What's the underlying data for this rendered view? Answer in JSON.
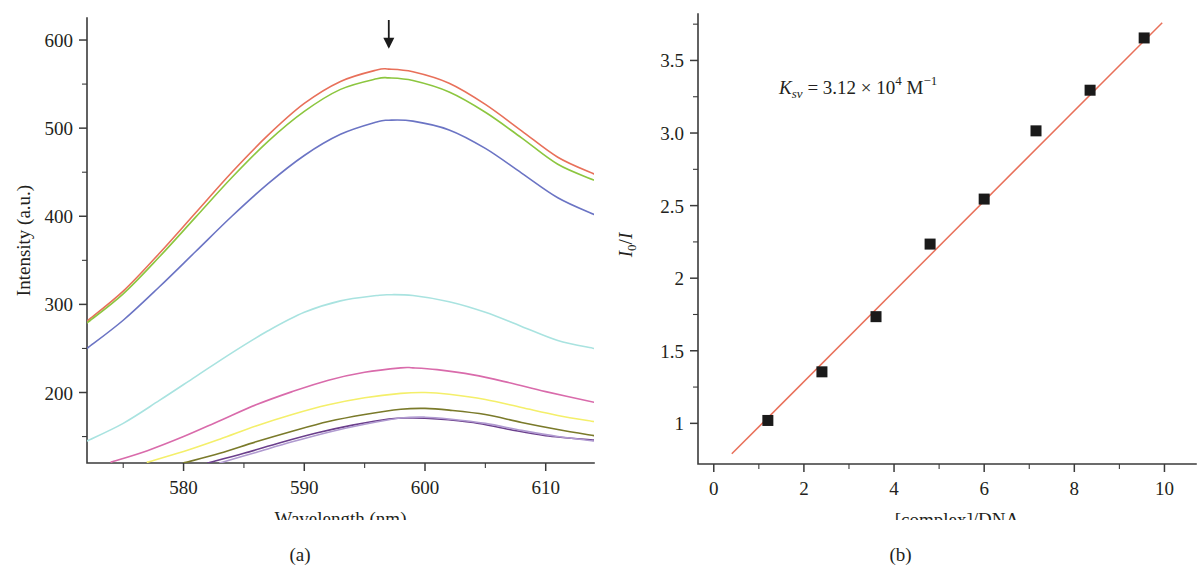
{
  "figure": {
    "panels": [
      {
        "id": "a",
        "caption": "(a)"
      },
      {
        "id": "b",
        "caption": "(b)"
      }
    ]
  },
  "chart_data": [
    {
      "panel": "a",
      "type": "line",
      "title": "",
      "xlabel": "Wavelength (nm)",
      "ylabel": "Intensity (a.u.)",
      "xlim": [
        572,
        614
      ],
      "ylim": [
        120,
        625
      ],
      "xticks": [
        580,
        590,
        600,
        610
      ],
      "xticklabels": [
        "580",
        "590",
        "600",
        "610"
      ],
      "xminorticks": [
        575,
        585,
        595,
        605
      ],
      "yticks": [
        200,
        300,
        400,
        500,
        600
      ],
      "yticklabels": [
        "200",
        "300",
        "400",
        "500",
        "600"
      ],
      "yminorticks": [
        150,
        250,
        350,
        450,
        550
      ],
      "grid": false,
      "legend": "none",
      "annotations": [
        {
          "name": "downward-arrow",
          "kind": "arrow",
          "x": 597,
          "y_top": 625,
          "y_bottom": 590
        }
      ],
      "series": [
        {
          "name": "curve-1-red",
          "color": "#e8705a",
          "x": [
            572,
            575,
            578,
            581,
            584,
            587,
            590,
            593,
            596,
            597,
            599,
            602,
            605,
            608,
            611,
            614
          ],
          "values": [
            281,
            315,
            358,
            404,
            450,
            492,
            528,
            553,
            566,
            567,
            564,
            551,
            527,
            497,
            467,
            448
          ]
        },
        {
          "name": "curve-2-green",
          "color": "#8cc63f",
          "x": [
            572,
            575,
            578,
            581,
            584,
            587,
            590,
            593,
            596,
            597,
            599,
            602,
            605,
            608,
            611,
            614
          ],
          "values": [
            279,
            312,
            354,
            399,
            444,
            485,
            519,
            544,
            556,
            557,
            554,
            541,
            518,
            489,
            459,
            441
          ]
        },
        {
          "name": "curve-3-blue",
          "color": "#6b74c4",
          "x": [
            572,
            575,
            578,
            581,
            584,
            587,
            590,
            593,
            596,
            597,
            599,
            602,
            605,
            608,
            611,
            614
          ],
          "values": [
            250,
            282,
            320,
            360,
            400,
            437,
            469,
            493,
            507,
            509,
            508,
            498,
            477,
            449,
            421,
            402
          ]
        },
        {
          "name": "curve-4-cyan",
          "color": "#a9e3e0",
          "x": [
            572,
            575,
            578,
            581,
            584,
            587,
            590,
            593,
            596,
            597,
            599,
            602,
            605,
            608,
            611,
            614
          ],
          "values": [
            145,
            165,
            191,
            218,
            245,
            270,
            291,
            304,
            310,
            311,
            310,
            303,
            291,
            275,
            259,
            250
          ]
        },
        {
          "name": "curve-5-magenta",
          "color": "#d96bab",
          "x": [
            574,
            577,
            580,
            583,
            586,
            589,
            592,
            595,
            598,
            599,
            601,
            604,
            607,
            610,
            614
          ],
          "values": [
            121,
            134,
            150,
            168,
            186,
            201,
            214,
            223,
            228,
            228,
            226,
            220,
            211,
            201,
            189
          ]
        },
        {
          "name": "curve-6-yellow",
          "color": "#f4ef6a",
          "x": [
            577,
            580,
            583,
            586,
            589,
            592,
            595,
            598,
            600,
            602,
            605,
            608,
            611,
            614
          ],
          "values": [
            121,
            133,
            147,
            162,
            175,
            186,
            194,
            199,
            200,
            198,
            192,
            183,
            174,
            167
          ]
        },
        {
          "name": "curve-7-olive",
          "color": "#7a7a2a",
          "x": [
            580,
            583,
            586,
            589,
            592,
            595,
            598,
            600,
            602,
            605,
            608,
            611,
            614
          ],
          "values": [
            120,
            131,
            144,
            156,
            167,
            175,
            181,
            182,
            180,
            175,
            166,
            158,
            151
          ]
        },
        {
          "name": "curve-8-purple",
          "color": "#6b3f8c",
          "x": [
            582,
            585,
            588,
            591,
            594,
            597,
            599,
            601,
            604,
            607,
            610,
            614
          ],
          "values": [
            120,
            131,
            143,
            154,
            163,
            170,
            171,
            170,
            166,
            158,
            151,
            146
          ]
        },
        {
          "name": "curve-9-lavender",
          "color": "#b09ad0",
          "x": [
            583,
            586,
            589,
            592,
            595,
            598,
            600,
            602,
            605,
            608,
            611,
            614
          ],
          "values": [
            120,
            132,
            144,
            155,
            164,
            171,
            172,
            170,
            165,
            157,
            150,
            145
          ]
        }
      ]
    },
    {
      "panel": "b",
      "type": "scatter",
      "title": "",
      "xlabel": "[complex]/DNA",
      "ylabel": "I₀/I",
      "xlim": [
        -0.35,
        10.7
      ],
      "ylim": [
        0.72,
        3.82
      ],
      "xticks": [
        0,
        2,
        4,
        6,
        8,
        10
      ],
      "xticklabels": [
        "0",
        "2",
        "4",
        "6",
        "8",
        "10"
      ],
      "xminorticks": [
        1,
        3,
        5,
        7,
        9
      ],
      "yticks": [
        1,
        1.5,
        2,
        2.5,
        3.0,
        3.5
      ],
      "yticklabels": [
        "1",
        "1.5",
        "2",
        "2.5",
        "3.0",
        "3.5"
      ],
      "yminorticks": [
        1.25,
        1.75,
        2.25,
        2.75,
        3.25,
        3.75
      ],
      "grid": false,
      "legend": "none",
      "marker": {
        "shape": "square",
        "color": "#1a1a1a",
        "size": 11
      },
      "points": [
        {
          "x": 1.2,
          "y": 1.02
        },
        {
          "x": 2.4,
          "y": 1.355
        },
        {
          "x": 3.6,
          "y": 1.735
        },
        {
          "x": 4.8,
          "y": 2.235
        },
        {
          "x": 6.0,
          "y": 2.545
        },
        {
          "x": 7.15,
          "y": 3.015
        },
        {
          "x": 8.35,
          "y": 3.295
        },
        {
          "x": 9.55,
          "y": 3.655
        }
      ],
      "fit": {
        "name": "linear-fit",
        "color": "#e8705a",
        "x_start": 0.4,
        "x_end": 9.95,
        "y_start": 0.79,
        "y_end": 3.76
      },
      "annotations": [
        {
          "name": "ksv-annotation",
          "kind": "text",
          "x": 1.45,
          "y": 3.27,
          "parts": [
            {
              "t": "K",
              "style": "italic"
            },
            {
              "t": "sv",
              "style": "sub-italic"
            },
            {
              "t": " = 3.12 × 10",
              "style": "normal"
            },
            {
              "t": "4",
              "style": "sup"
            },
            {
              "t": " M",
              "style": "normal"
            },
            {
              "t": "−1",
              "style": "sup"
            }
          ],
          "text": "Ksv = 3.12 × 10⁴ M⁻¹"
        }
      ]
    }
  ]
}
